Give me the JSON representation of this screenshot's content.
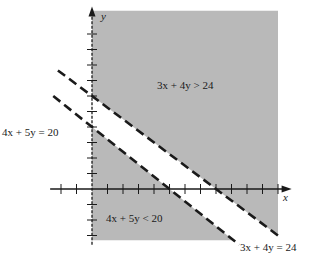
{
  "chart_data": {
    "type": "diagram",
    "title": "",
    "axes": {
      "x_label": "x",
      "y_label": "y",
      "x_range": [
        -3,
        12
      ],
      "y_range": [
        -3.6,
        11.4
      ],
      "tick_step": 1
    },
    "lines": [
      {
        "name": "line-4x5y",
        "equation": "4x + 5y = 20",
        "a": 4,
        "b": 5,
        "c": 20,
        "style": "dashed",
        "x_extent": [
          -2.5,
          9.5
        ]
      },
      {
        "name": "line-3x4y",
        "equation": "3x + 4y = 24",
        "a": 3,
        "b": 4,
        "c": 24,
        "style": "dashed",
        "x_extent": [
          -2.2,
          12.2
        ]
      }
    ],
    "regions": [
      {
        "name": "region-greater",
        "inequality": "3x + 4y > 24",
        "shaded": true
      },
      {
        "name": "region-less",
        "inequality": "4x + 5y < 20",
        "shaded": true
      }
    ],
    "shading_bounds": {
      "x": [
        0,
        12
      ],
      "y": [
        -3.3,
        11.5
      ]
    }
  },
  "labels": {
    "eq1": "4x + 5y = 20",
    "eq2": "3x + 4y = 24",
    "ineq_upper": "3x + 4y > 24",
    "ineq_lower": "4x + 5y < 20",
    "x_axis": "x",
    "y_axis": "y"
  },
  "colors": {
    "shade": "#b9b9b9",
    "ink": "#1a1a1a",
    "background": "#ffffff"
  }
}
